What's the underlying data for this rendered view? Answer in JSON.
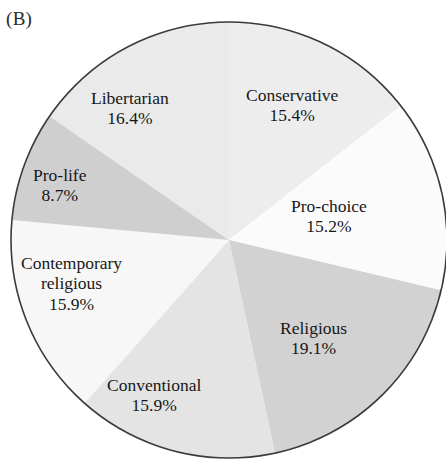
{
  "panel": {
    "label": "(B)"
  },
  "chart_data": {
    "type": "pie",
    "title": "",
    "subtitle": "",
    "xlabel": "",
    "ylabel": "",
    "legend_position": "none",
    "labels_inside_slices": true,
    "start_angle_deg": 0,
    "direction": "clockwise",
    "center": {
      "x": 229,
      "y": 240
    },
    "radius": 218,
    "outline_color": "#3a3a3a",
    "categories": [
      "Conservative",
      "Pro-choice",
      "Religious",
      "Conventional",
      "Contemporary religious",
      "Pro-life",
      "Libertarian"
    ],
    "values": [
      15.4,
      15.2,
      19.1,
      15.9,
      15.9,
      8.7,
      16.4
    ],
    "value_labels": [
      "15.4%",
      "15.2%",
      "19.1%",
      "15.9%",
      "15.9%",
      "8.7%",
      "16.4%"
    ],
    "colors": [
      "#ededed",
      "#fbfbfb",
      "#d2d2d2",
      "#e4e4e4",
      "#f7f7f7",
      "#cfcfcf",
      "#eaeaea"
    ],
    "slices": [
      {
        "name": "Conservative",
        "value": 15.4,
        "value_label": "15.4%",
        "color": "#ededed",
        "label_line1": "Conservative",
        "label_line2": ""
      },
      {
        "name": "Pro-choice",
        "value": 15.2,
        "value_label": "15.2%",
        "color": "#fbfbfb",
        "label_line1": "Pro-choice",
        "label_line2": ""
      },
      {
        "name": "Religious",
        "value": 19.1,
        "value_label": "19.1%",
        "color": "#d2d2d2",
        "label_line1": "Religious",
        "label_line2": ""
      },
      {
        "name": "Conventional",
        "value": 15.9,
        "value_label": "15.9%",
        "color": "#e4e4e4",
        "label_line1": "Conventional",
        "label_line2": ""
      },
      {
        "name": "Contemporary religious",
        "value": 15.9,
        "value_label": "15.9%",
        "color": "#f7f7f7",
        "label_line1": "Contemporary",
        "label_line2": "religious"
      },
      {
        "name": "Pro-life",
        "value": 8.7,
        "value_label": "8.7%",
        "color": "#cfcfcf",
        "label_line1": "Pro-life",
        "label_line2": ""
      },
      {
        "name": "Libertarian",
        "value": 16.4,
        "value_label": "16.4%",
        "color": "#eaeaea",
        "label_line1": "Libertarian",
        "label_line2": ""
      }
    ]
  }
}
